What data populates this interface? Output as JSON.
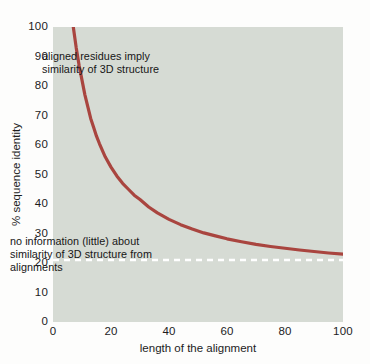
{
  "chart_data": {
    "type": "line",
    "title": "",
    "xlabel": "length of the alignment",
    "ylabel": "% sequence identity",
    "xlim": [
      0,
      100
    ],
    "ylim": [
      0,
      100
    ],
    "xticks": [
      "0",
      "20",
      "40",
      "60",
      "80",
      "100"
    ],
    "xtick_values": [
      0,
      20,
      40,
      60,
      80,
      100
    ],
    "yticks": [
      "0",
      "10",
      "20",
      "30",
      "40",
      "50",
      "60",
      "70",
      "80",
      "90",
      "100"
    ],
    "ytick_values": [
      0,
      10,
      20,
      30,
      40,
      50,
      60,
      70,
      80,
      90,
      100
    ],
    "grid": false,
    "legend": null,
    "series": [
      {
        "name": "twilight-zone curve",
        "color": "#a9453f",
        "style": "solid",
        "x": [
          7,
          8,
          9,
          10,
          11,
          12,
          13,
          14,
          15,
          16,
          18,
          20,
          22,
          24,
          26,
          28,
          30,
          33,
          36,
          40,
          44,
          48,
          52,
          56,
          60,
          65,
          70,
          75,
          80,
          85,
          90,
          95,
          100
        ],
        "y": [
          100,
          93,
          87,
          82,
          77,
          73,
          69,
          66,
          63,
          60.5,
          56,
          52.5,
          49.5,
          47,
          45,
          43,
          41.5,
          39,
          37,
          34.8,
          33,
          31.5,
          30.2,
          29.2,
          28.2,
          27.2,
          26.3,
          25.6,
          25.0,
          24.4,
          23.9,
          23.4,
          23.0
        ]
      }
    ],
    "reference_lines": [
      {
        "name": "twilight-zone threshold",
        "orientation": "horizontal",
        "value": 21,
        "color": "#ffffff",
        "style": "dashed"
      }
    ],
    "annotations": [
      {
        "name": "annotation-upper",
        "text": "aligned residues imply\nsimilarity of 3D structure",
        "x": 22,
        "y": 82
      },
      {
        "name": "annotation-lower",
        "text": "no information (little) about\nsimilarity of 3D structure from\nalignments",
        "x": 4,
        "y": 19
      }
    ],
    "colors": {
      "plot_background": "#d6dbd4",
      "figure_background": "#fdfdfc",
      "curve": "#a9453f",
      "reference_line": "#ffffff",
      "text": "#1c1c1c"
    }
  }
}
